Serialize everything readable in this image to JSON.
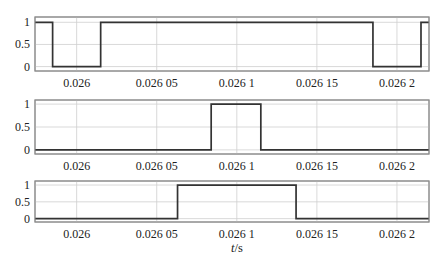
{
  "chart_data": [
    {
      "type": "line",
      "title": "",
      "xlabel": "",
      "ylabel": "",
      "xlim": [
        0.025974,
        0.02622
      ],
      "ylim": [
        -0.1,
        1.12
      ],
      "grid": true,
      "legend": "none",
      "xticks": [
        0.026,
        0.02605,
        0.0261,
        0.02615,
        0.0262
      ],
      "xtick_labels": [
        "0.026",
        "0.026 05",
        "0.026 1",
        "0.026 15",
        "0.026 2"
      ],
      "yticks": [
        0,
        0.5,
        1
      ],
      "ytick_labels": [
        "0",
        "0.5",
        "1"
      ],
      "series": [
        {
          "name": "switch signal 1",
          "drawstyle": "steps-post",
          "x": [
            0.025974,
            0.025985,
            0.026015,
            0.026185,
            0.026215,
            0.02622
          ],
          "y": [
            1,
            0,
            1,
            0,
            1,
            1
          ]
        }
      ]
    },
    {
      "type": "line",
      "title": "",
      "xlabel": "",
      "ylabel": "",
      "xlim": [
        0.025974,
        0.02622
      ],
      "ylim": [
        -0.09,
        1.09
      ],
      "grid": true,
      "legend": "none",
      "xticks": [
        0.026,
        0.02605,
        0.0261,
        0.02615,
        0.0262
      ],
      "xtick_labels": [
        "0.026",
        "0.026 05",
        "0.026 1",
        "0.026 15",
        "0.026 2"
      ],
      "yticks": [
        0,
        0.5,
        1
      ],
      "ytick_labels": [
        "0",
        "0.5",
        "1"
      ],
      "series": [
        {
          "name": "switch signal 2",
          "drawstyle": "steps-post",
          "x": [
            0.025974,
            0.026084,
            0.026115,
            0.02622
          ],
          "y": [
            0,
            1,
            0,
            0
          ]
        }
      ]
    },
    {
      "type": "line",
      "title": "",
      "xlabel": "t/s",
      "xlabel_var": "t",
      "xlabel_unit": "/s",
      "ylabel": "",
      "xlim": [
        0.025974,
        0.02622
      ],
      "ylim": [
        -0.1,
        1.12
      ],
      "grid": true,
      "legend": "none",
      "xticks": [
        0.026,
        0.02605,
        0.0261,
        0.02615,
        0.0262
      ],
      "xtick_labels": [
        "0.026",
        "0.026 05",
        "0.026 1",
        "0.026 15",
        "0.026 2"
      ],
      "yticks": [
        0,
        0.5,
        1
      ],
      "ytick_labels": [
        "0",
        "0.5",
        "1"
      ],
      "series": [
        {
          "name": "switch signal 3",
          "drawstyle": "steps-post",
          "x": [
            0.025974,
            0.026063,
            0.026137,
            0.02622
          ],
          "y": [
            0,
            1,
            0,
            0
          ]
        }
      ]
    }
  ]
}
